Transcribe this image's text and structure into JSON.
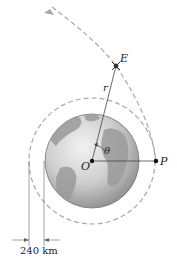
{
  "diagram": {
    "labels": {
      "E": "E",
      "r": "r",
      "theta": "θ",
      "O": "O",
      "P": "P"
    },
    "dimension": {
      "value_label": "240 km"
    },
    "colors": {
      "orbit_dash": "#a8a8a8",
      "line": "#444444",
      "earth_light": "#e6e6e6",
      "earth_dark": "#8a8a8a",
      "point": "#111111"
    }
  }
}
